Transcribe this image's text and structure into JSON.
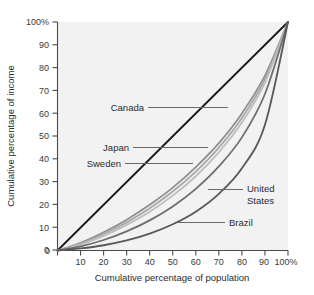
{
  "chart_data": {
    "type": "line",
    "title": "",
    "xlabel": "Cumulative percentage of population",
    "ylabel": "Cumulative percentage of income",
    "xlim": [
      0,
      100
    ],
    "ylim": [
      0,
      100
    ],
    "grid": false,
    "legend_position": "inline-callout-labels",
    "x_tick_labels": [
      "0",
      "10",
      "20",
      "30",
      "40",
      "50",
      "60",
      "70",
      "80",
      "90",
      "100%"
    ],
    "x_tick_values": [
      0,
      10,
      20,
      30,
      40,
      50,
      60,
      70,
      80,
      90,
      100
    ],
    "y_tick_labels": [
      "0",
      "10",
      "20",
      "30",
      "40",
      "50",
      "60",
      "70",
      "80",
      "90",
      "100%"
    ],
    "y_tick_values": [
      0,
      10,
      20,
      30,
      40,
      50,
      60,
      70,
      80,
      90,
      100
    ],
    "x": [
      0,
      10,
      20,
      30,
      40,
      50,
      60,
      70,
      80,
      90,
      100
    ],
    "series": [
      {
        "name": "Line of equality",
        "color": "#1a1a1a",
        "width": 1.8,
        "values": [
          0,
          10,
          20,
          30,
          40,
          50,
          60,
          70,
          80,
          90,
          100
        ]
      },
      {
        "name": "Sweden",
        "color": "#8f8f8f",
        "width": 1.8,
        "values": [
          0,
          3.4,
          8.0,
          13.5,
          20.0,
          27.5,
          36.5,
          47.0,
          60.0,
          76.5,
          100
        ]
      },
      {
        "name": "Japan",
        "color": "#a8a8a8",
        "width": 1.8,
        "values": [
          0,
          3.0,
          7.2,
          12.3,
          18.5,
          25.8,
          34.5,
          45.0,
          58.0,
          75.0,
          100
        ]
      },
      {
        "name": "Canada",
        "color": "#bdbdbd",
        "width": 1.8,
        "values": [
          0,
          2.6,
          6.4,
          11.2,
          17.0,
          24.0,
          32.5,
          43.0,
          56.0,
          73.5,
          100
        ]
      },
      {
        "name": "United States",
        "color": "#6e6e6e",
        "width": 1.8,
        "values": [
          0,
          1.8,
          4.6,
          8.4,
          13.2,
          19.3,
          27.0,
          36.8,
          49.5,
          68.5,
          100
        ]
      },
      {
        "name": "Brazil",
        "color": "#585858",
        "width": 1.8,
        "values": [
          0,
          0.9,
          2.3,
          4.4,
          7.4,
          11.5,
          17.0,
          24.8,
          36.0,
          55.0,
          100
        ]
      }
    ],
    "annotations": [
      {
        "label": "Canada",
        "align": "end"
      },
      {
        "label": "Japan",
        "align": "end"
      },
      {
        "label": "Sweden",
        "align": "end"
      },
      {
        "label": "United",
        "align": "start"
      },
      {
        "label": "States",
        "align": "start"
      },
      {
        "label": "Brazil",
        "align": "start"
      }
    ]
  },
  "colors": {
    "panel_background": "#f2f2f2",
    "page_background": "#ffffff",
    "axis": "#4a4a4a",
    "text": "#2b2b2b",
    "leader": "#6a6a6a"
  }
}
